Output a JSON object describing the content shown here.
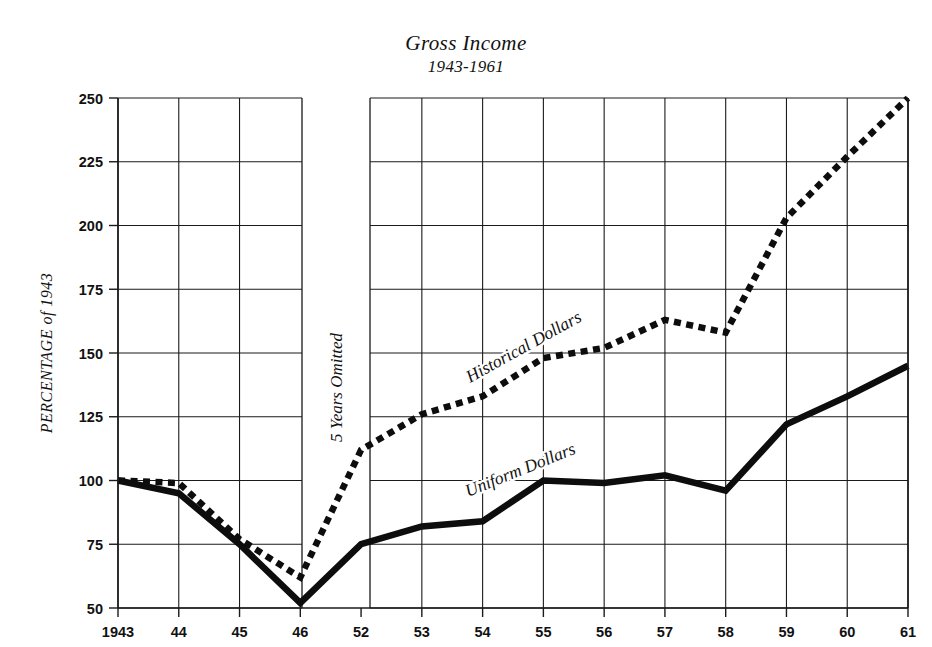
{
  "title": "Gross Income",
  "subtitle": "1943-1961",
  "y_axis_title": "PERCENTAGE of 1943",
  "gap_note": "5 Years Omitted",
  "annotations": {
    "historical": "Historical  Dollars",
    "uniform": "Uniform  Dollars"
  },
  "colors": {
    "ink": "#0d0d0d",
    "grid": "#1a1a1a",
    "background": "#ffffff"
  },
  "chart_data": {
    "type": "line",
    "title": "Gross Income",
    "subtitle": "1943-1961",
    "xlabel": "",
    "ylabel": "PERCENTAGE of 1943",
    "ylim": [
      50,
      250
    ],
    "ytick_step": 25,
    "yticks": [
      50,
      75,
      100,
      125,
      150,
      175,
      200,
      225,
      250
    ],
    "ytick_labels": [
      "50",
      "75",
      "100",
      "125",
      "150",
      "175",
      "200",
      "225",
      "250"
    ],
    "x": [
      "1943",
      "44",
      "45",
      "46",
      "52",
      "53",
      "54",
      "55",
      "56",
      "57",
      "58",
      "59",
      "60",
      "61"
    ],
    "xtick_labels": [
      "1943",
      "44",
      "45",
      "46",
      "52",
      "53",
      "54",
      "55",
      "56",
      "57",
      "58",
      "59",
      "60",
      "61"
    ],
    "axis_break": {
      "after": "46",
      "before": "52",
      "label": "5 Years Omitted",
      "years_omitted": 5
    },
    "grid": true,
    "legend": "inline-annotations",
    "series": [
      {
        "name": "Historical Dollars",
        "style": "dashed",
        "values": [
          100,
          99,
          77,
          62,
          112,
          126,
          133,
          148,
          152,
          163,
          158,
          203,
          227,
          250
        ]
      },
      {
        "name": "Uniform Dollars",
        "style": "solid",
        "values": [
          100,
          95,
          75,
          52,
          75,
          82,
          84,
          100,
          99,
          102,
          96,
          122,
          133,
          145
        ]
      }
    ]
  }
}
